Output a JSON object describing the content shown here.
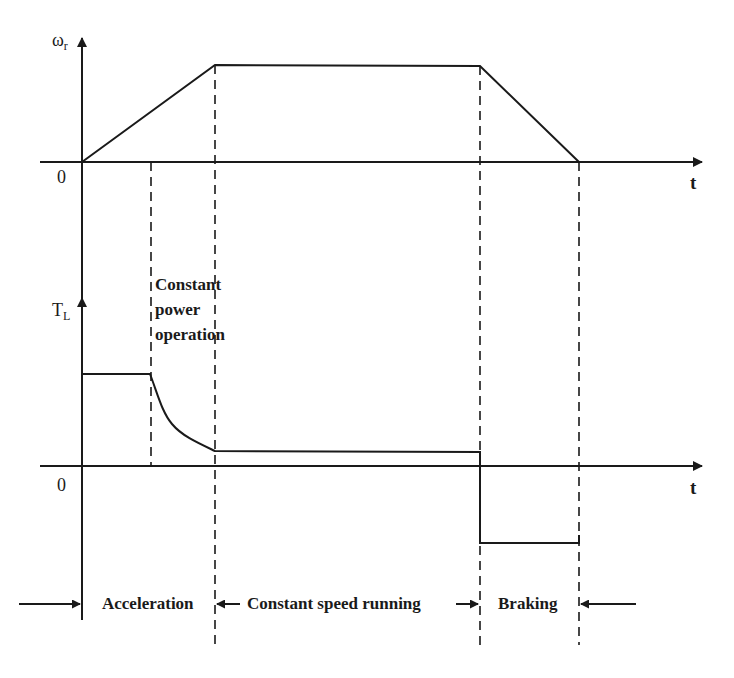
{
  "speed_plot": {
    "y_axis_symbol": "ω",
    "y_axis_subscript": "r",
    "x_axis_label": "t",
    "origin_label": "0"
  },
  "torque_plot": {
    "y_axis_symbol": "T",
    "y_axis_subscript": "L",
    "x_axis_label": "t",
    "origin_label": "0",
    "annotation_lines": [
      "Constant",
      "power",
      "operation"
    ]
  },
  "phases": {
    "acceleration": "Acceleration",
    "constant_speed": "Constant speed running",
    "braking": "Braking"
  },
  "colors": {
    "line": "#1a1a1a",
    "background": "#ffffff"
  }
}
